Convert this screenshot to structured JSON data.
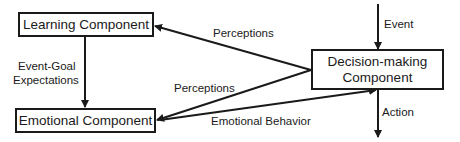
{
  "nodes": {
    "learning": "Learning Component",
    "emotional": "Emotional Component",
    "decision_line1": "Decision-making",
    "decision_line2": "Component"
  },
  "edges": {
    "perceptions_top": "Perceptions",
    "perceptions_mid": "Perceptions",
    "event_goal_line1": "Event-Goal",
    "event_goal_line2": "Expectations",
    "emotional_behavior": "Emotional Behavior",
    "event": "Event",
    "action": "Action"
  }
}
